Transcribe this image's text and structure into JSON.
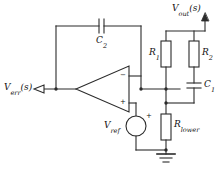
{
  "diagram": {
    "type": "schematic",
    "stroke_color": "#2b2b2b",
    "text_color": "#111111",
    "background": "#ffffff"
  },
  "labels": {
    "v_err": {
      "symbol": "V",
      "subscript": "err",
      "arg": "(s)",
      "full": "V_err(s)"
    },
    "v_out": {
      "symbol": "V",
      "subscript": "out",
      "arg": "(s)",
      "full": "V_out(s)"
    },
    "v_ref": {
      "symbol": "V",
      "subscript": "ref",
      "arg": "",
      "full": "V_ref"
    },
    "c1": {
      "symbol": "C",
      "subscript": "1",
      "arg": "",
      "full": "C_1"
    },
    "c2": {
      "symbol": "C",
      "subscript": "2",
      "arg": "",
      "full": "C_2"
    },
    "r1": {
      "symbol": "R",
      "subscript": "1",
      "arg": "",
      "full": "R_1"
    },
    "r2": {
      "symbol": "R",
      "subscript": "2",
      "arg": "",
      "full": "R_2"
    },
    "r_lower": {
      "symbol": "R",
      "subscript": "lower",
      "arg": "",
      "full": "R_lower"
    }
  },
  "opamp": {
    "inverting_sign": "−",
    "noninverting_sign": "+",
    "orientation": "apex-left",
    "output_side": "left",
    "input_side": "right"
  },
  "source": {
    "v_ref_polarity_sign": "+",
    "shape": "circle"
  },
  "components": [
    {
      "name": "C2",
      "kind": "capacitor",
      "orientation": "horizontal",
      "label": "C_2"
    },
    {
      "name": "R1",
      "kind": "resistor",
      "orientation": "vertical",
      "label": "R_1"
    },
    {
      "name": "R2",
      "kind": "resistor",
      "orientation": "vertical",
      "label": "R_2"
    },
    {
      "name": "C1",
      "kind": "capacitor",
      "orientation": "horizontal",
      "label": "C_1"
    },
    {
      "name": "Rlower",
      "kind": "resistor",
      "orientation": "vertical",
      "label": "R_lower"
    },
    {
      "name": "Vref",
      "kind": "voltage-source",
      "orientation": "vertical",
      "label": "V_ref"
    },
    {
      "name": "U1",
      "kind": "opamp",
      "orientation": "apex-left",
      "label": ""
    },
    {
      "name": "GND",
      "kind": "ground",
      "orientation": "vertical",
      "label": ""
    }
  ]
}
